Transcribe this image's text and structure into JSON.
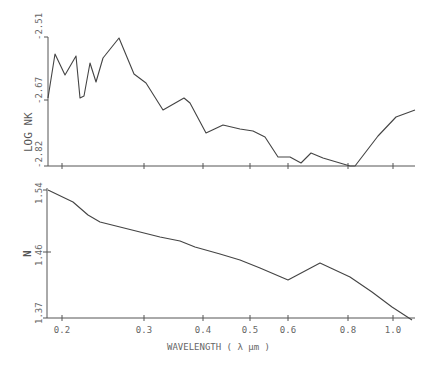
{
  "chart_data": [
    {
      "type": "line",
      "panel": "top",
      "ylabel": "LOG NK",
      "xlabel": "",
      "yticks": [
        "-2.51",
        "-2.67",
        "-2.82"
      ],
      "ylim": [
        -2.82,
        -2.51
      ],
      "xscale": "log",
      "xlim": [
        0.19,
        1.1
      ],
      "x": [
        0.19,
        0.195,
        0.205,
        0.215,
        0.219,
        0.223,
        0.229,
        0.236,
        0.243,
        0.262,
        0.29,
        0.303,
        0.33,
        0.37,
        0.41,
        0.45,
        0.5,
        0.53,
        0.56,
        0.59,
        0.62,
        0.65,
        0.67,
        0.71,
        0.78,
        0.8,
        0.88,
        0.96,
        1.1
      ],
      "values": [
        -2.67,
        -2.58,
        -2.62,
        -2.585,
        -2.67,
        -2.665,
        -2.597,
        -2.635,
        -2.587,
        -2.51,
        -2.585,
        -2.6,
        -2.656,
        -2.63,
        -2.705,
        -2.687,
        -2.697,
        -2.697,
        -2.71,
        -2.752,
        -2.752,
        -2.765,
        -2.745,
        -2.755,
        -2.77,
        -2.77,
        -2.71,
        -2.67,
        -2.655
      ]
    },
    {
      "type": "line",
      "panel": "bottom",
      "ylabel": "N",
      "xlabel": "WAVELENGTH ( λ μm )",
      "yticks": [
        "1.54",
        "1.46",
        "1.37"
      ],
      "ylim": [
        1.37,
        1.54
      ],
      "xscale": "log",
      "xlim": [
        0.19,
        1.1
      ],
      "xticks": [
        "0.2",
        "0.3",
        "0.4",
        "0.5",
        "0.6",
        "0.8",
        "1.0"
      ],
      "x": [
        0.19,
        0.21,
        0.22,
        0.23,
        0.25,
        0.28,
        0.31,
        0.35,
        0.36,
        0.38,
        0.41,
        0.45,
        0.5,
        0.55,
        0.6,
        0.7,
        0.82,
        0.93,
        1.08
      ],
      "values": [
        1.54,
        1.525,
        1.508,
        1.5,
        1.494,
        1.487,
        1.481,
        1.475,
        1.472,
        1.467,
        1.458,
        1.45,
        1.438,
        1.42,
        1.411,
        1.442,
        1.42,
        1.397,
        1.37
      ]
    }
  ],
  "top_panel": {
    "ylabel": "LOG NK",
    "yticks": [
      "-2.51",
      "-2.67",
      "-2.82"
    ]
  },
  "bottom_panel": {
    "ylabel": "N",
    "yticks": [
      "1.54",
      "1.46",
      "1.37"
    ]
  },
  "xaxis": {
    "ticks": [
      "0.2",
      "0.3",
      "0.4",
      "0.5",
      "0.6",
      "0.8",
      "1.0"
    ],
    "label": "WAVELENGTH ( λ μm )"
  },
  "pixel_paths": {
    "top": "48,98 55,54 65,75 76,56 80,98 84,96 90,63 96,82 103,58 119,38 134,74 146,83 163,110 184,98 190,103 206,133 223,125 240,129 253,131 265,137 278,157 290,157 301,163 311,153 323,158 350,166 355,166 378,136 396,117 415,110",
    "bottom": "48,190 73,202 88,215 100,222 120,227 140,232 160,237 180,241 185,243 195,247 220,254 240,260 260,268 288,280 320,263 350,277 372,292 392,307 412,320"
  }
}
